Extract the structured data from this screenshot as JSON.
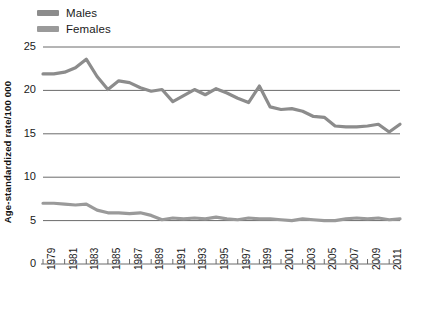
{
  "legend": {
    "position": "top-left",
    "entries": [
      {
        "label": "Males",
        "color": "#8c8c8c",
        "swatch_name": "legend-swatch-males"
      },
      {
        "label": "Females",
        "color": "#9a9a9a",
        "swatch_name": "legend-swatch-females"
      }
    ]
  },
  "axes": {
    "ylabel": "Age-standardized rate/100 000",
    "xlabel": "",
    "yticks": [
      0,
      5,
      10,
      15,
      20,
      25
    ],
    "ytick_labels": [
      "0",
      "5",
      "10",
      "15",
      "20",
      "25"
    ],
    "ylim": [
      0,
      25
    ],
    "xlim": [
      1979,
      2012
    ],
    "xtick_labels": [
      "1979",
      "1981",
      "1983",
      "1985",
      "1987",
      "1989",
      "1991",
      "1993",
      "1995",
      "1997",
      "1999",
      "2001",
      "2003",
      "2005",
      "2007",
      "2009",
      "2011"
    ],
    "grid": "horizontal"
  },
  "chart_data": {
    "type": "line",
    "title": "",
    "subtitle": "",
    "xlabel": "",
    "ylabel": "Age-standardized rate/100 000",
    "ylim": [
      0,
      25
    ],
    "xlim": [
      1979,
      2012
    ],
    "grid": true,
    "legend_position": "top-left",
    "x": [
      1979,
      1980,
      1981,
      1982,
      1983,
      1984,
      1985,
      1986,
      1987,
      1988,
      1989,
      1990,
      1991,
      1992,
      1993,
      1994,
      1995,
      1996,
      1997,
      1998,
      1999,
      2000,
      2001,
      2002,
      2003,
      2004,
      2005,
      2006,
      2007,
      2008,
      2009,
      2010,
      2011,
      2012
    ],
    "series": [
      {
        "name": "Males",
        "color": "#8c8c8c",
        "values": [
          21.9,
          21.9,
          22.1,
          22.6,
          23.6,
          21.6,
          20.1,
          21.1,
          20.9,
          20.3,
          19.9,
          20.1,
          18.7,
          19.4,
          20.1,
          19.5,
          20.2,
          19.7,
          19.1,
          18.6,
          20.5,
          18.1,
          17.8,
          17.9,
          17.6,
          17.0,
          16.9,
          15.9,
          15.8,
          15.8,
          15.9,
          16.1,
          15.2,
          16.1
        ]
      },
      {
        "name": "Females",
        "color": "#9a9a9a",
        "values": [
          7.0,
          7.0,
          6.9,
          6.8,
          6.9,
          6.2,
          5.9,
          5.9,
          5.8,
          5.9,
          5.6,
          5.1,
          5.3,
          5.2,
          5.3,
          5.2,
          5.4,
          5.2,
          5.1,
          5.3,
          5.2,
          5.2,
          5.1,
          5.0,
          5.2,
          5.1,
          5.0,
          5.0,
          5.2,
          5.3,
          5.2,
          5.3,
          5.1,
          5.2
        ]
      }
    ]
  },
  "geometry": {
    "plot_left": 43,
    "plot_right": 400,
    "y_top_value_px": 47,
    "y_bottom_value_px": 264,
    "gridline_color": "#6b6b6b",
    "axis_color": "#6b6b6b"
  }
}
